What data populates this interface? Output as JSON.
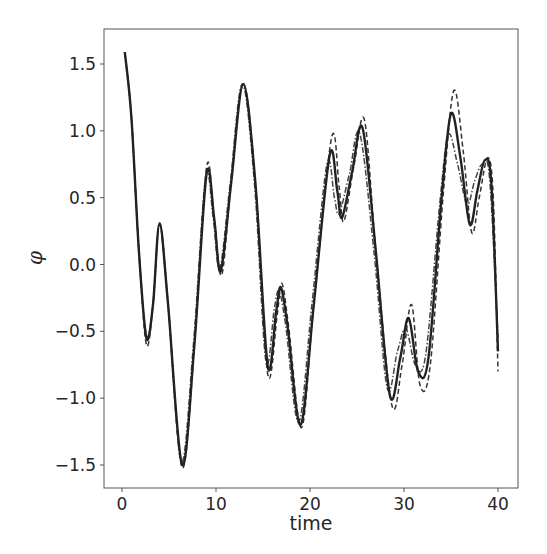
{
  "chart_data": {
    "type": "line",
    "title": "",
    "xlabel": "time",
    "ylabel": "φ",
    "xlim": [
      -2,
      42
    ],
    "ylim": [
      -1.68,
      1.78
    ],
    "xticks": [
      0,
      10,
      20,
      30,
      40
    ],
    "xtick_labels": [
      "0",
      "10",
      "20",
      "30",
      "40"
    ],
    "yticks": [
      1.5,
      1.0,
      0.5,
      0.0,
      -0.5,
      -1.0,
      -1.5
    ],
    "ytick_labels": [
      "1.5",
      "1.0",
      "0.5",
      "0.0",
      "−0.5",
      "−1.0",
      "−1.5"
    ],
    "grid": false,
    "legend": null,
    "series": [
      {
        "name": "solid",
        "style": "solid",
        "color": "#222222",
        "x": [
          0.3,
          1.0,
          1.8,
          2.6,
          3.3,
          4.0,
          4.9,
          6.4,
          7.7,
          9.0,
          9.8,
          10.5,
          11.6,
          12.9,
          14.2,
          15.5,
          16.4,
          16.9,
          17.6,
          19.0,
          20.4,
          22.1,
          22.9,
          23.4,
          24.5,
          25.6,
          27.0,
          28.5,
          29.6,
          30.5,
          31.5,
          32.6,
          34.0,
          35.0,
          36.0,
          37.0,
          37.8,
          38.6,
          39.3,
          40.0
        ],
        "y": [
          1.59,
          1.1,
          0.1,
          -0.55,
          -0.3,
          0.31,
          -0.3,
          -1.5,
          -0.6,
          0.68,
          0.35,
          -0.05,
          0.6,
          1.35,
          0.6,
          -0.76,
          -0.35,
          -0.17,
          -0.45,
          -1.2,
          -0.3,
          0.82,
          0.55,
          0.35,
          0.7,
          1.02,
          0.1,
          -0.98,
          -0.7,
          -0.4,
          -0.8,
          -0.7,
          0.5,
          1.13,
          0.8,
          0.3,
          0.55,
          0.78,
          0.6,
          -0.65
        ]
      },
      {
        "name": "dashed",
        "style": "dashed",
        "color": "#333333",
        "x": [
          0.3,
          1.0,
          1.8,
          2.6,
          3.3,
          4.0,
          4.9,
          6.4,
          7.7,
          9.0,
          9.8,
          10.6,
          11.6,
          12.9,
          14.2,
          15.5,
          16.5,
          17.0,
          17.7,
          19.1,
          20.4,
          22.3,
          23.1,
          23.6,
          24.7,
          25.8,
          27.0,
          28.7,
          29.8,
          30.8,
          31.7,
          32.8,
          34.2,
          35.3,
          36.3,
          37.2,
          38.0,
          38.9,
          39.5,
          40.0
        ],
        "y": [
          1.59,
          1.1,
          0.1,
          -0.6,
          -0.3,
          0.3,
          -0.3,
          -1.52,
          -0.6,
          0.73,
          0.35,
          -0.08,
          0.6,
          1.35,
          0.6,
          -0.82,
          -0.38,
          -0.14,
          -0.45,
          -1.22,
          -0.3,
          0.95,
          0.58,
          0.32,
          0.75,
          1.08,
          0.1,
          -1.05,
          -0.75,
          -0.3,
          -0.9,
          -0.75,
          0.55,
          1.3,
          0.85,
          0.24,
          0.5,
          0.8,
          0.5,
          -0.8
        ]
      },
      {
        "name": "dash-dot",
        "style": "dashdot",
        "color": "#444444",
        "x": [
          0.3,
          1.0,
          1.8,
          2.6,
          3.3,
          4.0,
          4.9,
          6.3,
          7.6,
          8.9,
          9.7,
          10.4,
          11.5,
          12.8,
          14.1,
          15.3,
          16.2,
          16.7,
          17.4,
          18.8,
          20.2,
          21.8,
          22.6,
          23.1,
          24.2,
          25.3,
          26.8,
          28.2,
          29.3,
          30.2,
          31.2,
          32.3,
          33.8,
          34.7,
          35.7,
          36.7,
          37.5,
          38.3,
          39.1,
          40.0
        ],
        "y": [
          1.59,
          1.1,
          0.1,
          -0.53,
          -0.3,
          0.31,
          -0.3,
          -1.48,
          -0.6,
          0.66,
          0.35,
          -0.03,
          0.6,
          1.35,
          0.6,
          -0.72,
          -0.33,
          -0.2,
          -0.45,
          -1.18,
          -0.3,
          0.75,
          0.5,
          0.38,
          0.68,
          0.98,
          0.1,
          -0.92,
          -0.65,
          -0.48,
          -0.75,
          -0.68,
          0.45,
          0.97,
          0.75,
          0.45,
          0.62,
          0.75,
          0.65,
          -0.55
        ]
      }
    ]
  }
}
